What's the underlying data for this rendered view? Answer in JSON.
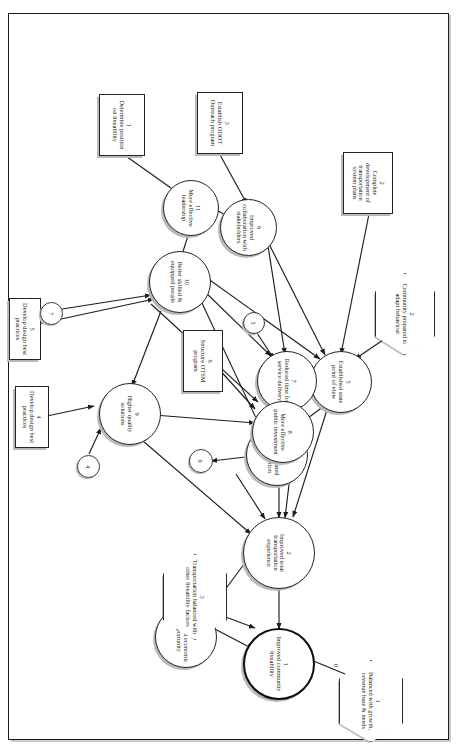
{
  "page": {
    "side_caption": "",
    "background": "#ffffff",
    "border_color": "#1b1b1b"
  },
  "diagram": {
    "type": "influence-diagram",
    "title": "",
    "legend": {
      "ellipse": "outcome",
      "hexagon": "external factor",
      "rectangle": "action",
      "bubble": "reference marker"
    },
    "nodes": [
      {
        "id": "o1",
        "shape": "ellipse",
        "number": "1",
        "label": "Improved community liveability",
        "emphasis": "primary"
      },
      {
        "id": "o2",
        "shape": "ellipse",
        "number": "2",
        "label": "Improved total transportation experience",
        "emphasis": "normal"
      },
      {
        "id": "o3",
        "shape": "ellipse",
        "number": "3",
        "label": "Enhanced economic opportunity",
        "emphasis": "normal"
      },
      {
        "id": "o4",
        "shape": "ellipse",
        "number": "4",
        "label": "More integrated state direction",
        "emphasis": "normal"
      },
      {
        "id": "o5",
        "shape": "ellipse",
        "number": "5",
        "label": "Established state point of view",
        "emphasis": "normal"
      },
      {
        "id": "o6",
        "shape": "ellipse",
        "number": "6",
        "label": "Improved collaboration with stakeholders",
        "emphasis": "normal"
      },
      {
        "id": "o7",
        "shape": "ellipse",
        "number": "7",
        "label": "Reduced time for service delivery",
        "emphasis": "normal"
      },
      {
        "id": "o8",
        "shape": "ellipse",
        "number": "8",
        "label": "More effective public investment",
        "emphasis": "normal"
      },
      {
        "id": "o9",
        "shape": "ellipse",
        "number": "9",
        "label": "Higher quality solutions",
        "emphasis": "normal"
      },
      {
        "id": "o10",
        "shape": "ellipse",
        "number": "10",
        "label": "Better skilled & equipped people",
        "emphasis": "normal"
      },
      {
        "id": "o11",
        "shape": "ellipse",
        "number": "11",
        "label": "More effective leadership",
        "emphasis": "normal"
      },
      {
        "id": "h1",
        "shape": "hexagon",
        "number": "1",
        "label": "Balanced with growth, revenue base & needs"
      },
      {
        "id": "h2",
        "shape": "hexagon",
        "number": "2",
        "label": "Community prepared to adapt behaviour"
      },
      {
        "id": "h3",
        "shape": "hexagon",
        "number": "3",
        "label": "Transportation balanced with other liveability factors"
      },
      {
        "id": "a1",
        "shape": "rectangle",
        "number": "1",
        "label": "Determine position on liveability"
      },
      {
        "id": "a2",
        "shape": "rectangle",
        "number": "2",
        "label": "Complete development of transportation system plans"
      },
      {
        "id": "a3",
        "shape": "rectangle",
        "number": "3",
        "label": "Establish ODOT Outreach program"
      },
      {
        "id": "a4",
        "shape": "rectangle",
        "number": "4",
        "label": "Develop design best practices"
      },
      {
        "id": "a5",
        "shape": "rectangle",
        "number": "5",
        "label": "Develop design best practices"
      },
      {
        "id": "a6",
        "shape": "rectangle",
        "number": "6",
        "label": "Structure OTSM program"
      }
    ],
    "bubbles": [
      {
        "id": "b9",
        "label": "9"
      },
      {
        "id": "b5",
        "label": "5"
      },
      {
        "id": "b4",
        "label": "4"
      },
      {
        "id": "b7",
        "label": "7"
      }
    ],
    "edge_labels": [
      {
        "id": "e-h1-o1",
        "label": "0"
      }
    ],
    "edges": [
      {
        "from": "o2",
        "to": "o1"
      },
      {
        "from": "h3",
        "to": "o1"
      },
      {
        "from": "h1",
        "to": "o1"
      },
      {
        "from": "o3",
        "to": "o1"
      },
      {
        "from": "o2",
        "to": "o3"
      },
      {
        "from": "o4",
        "to": "o2"
      },
      {
        "from": "o8",
        "to": "o2"
      },
      {
        "from": "o5",
        "to": "o2"
      },
      {
        "from": "o7",
        "to": "o2"
      },
      {
        "from": "o9",
        "to": "o2"
      },
      {
        "from": "o9",
        "to": "o8"
      },
      {
        "from": "o10",
        "to": "o8"
      },
      {
        "from": "o7",
        "to": "o8"
      },
      {
        "from": "a6",
        "to": "o8"
      },
      {
        "from": "o4",
        "to": "b9"
      },
      {
        "from": "h2",
        "to": "o5"
      },
      {
        "from": "o6",
        "to": "o5"
      },
      {
        "from": "a2",
        "to": "o5"
      },
      {
        "from": "o10",
        "to": "o5"
      },
      {
        "from": "o5",
        "to": "o4"
      },
      {
        "from": "o10",
        "to": "o4"
      },
      {
        "from": "o6",
        "to": "o7"
      },
      {
        "from": "b5",
        "to": "o7"
      },
      {
        "from": "o10",
        "to": "o7"
      },
      {
        "from": "o10",
        "to": "o9"
      },
      {
        "from": "b4",
        "to": "o9"
      },
      {
        "from": "a4",
        "to": "o9"
      },
      {
        "from": "o11",
        "to": "o6"
      },
      {
        "from": "a3",
        "to": "o6"
      },
      {
        "from": "o11",
        "to": "o10"
      },
      {
        "from": "b7",
        "to": "o10"
      },
      {
        "from": "a5",
        "to": "o10"
      },
      {
        "from": "a1",
        "to": "o11"
      }
    ]
  }
}
